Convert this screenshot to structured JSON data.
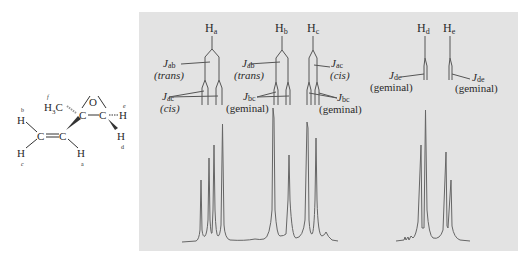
{
  "molecule": {
    "name": "2-methyl-2-vinyloxirane",
    "atoms": {
      "O": "O",
      "C": "C",
      "H": "H",
      "H3C_main": "H",
      "H3C_sub": "3",
      "H3C_tail": "C"
    },
    "proton_labels": {
      "a": "a",
      "b": "b",
      "c": "c",
      "d": "d",
      "e": "e",
      "f": "f"
    }
  },
  "spectrum": {
    "background_color": "#e3e3e3",
    "line_color": "#555555",
    "signals": [
      {
        "id": "Ha",
        "label_main": "H",
        "label_sub": "a"
      },
      {
        "id": "Hb",
        "label_main": "H",
        "label_sub": "b"
      },
      {
        "id": "Hc",
        "label_main": "H",
        "label_sub": "c"
      },
      {
        "id": "Hd",
        "label_main": "H",
        "label_sub": "d"
      },
      {
        "id": "He",
        "label_main": "H",
        "label_sub": "e"
      }
    ],
    "coupling_labels": [
      {
        "id": "Jab_a",
        "J": "J",
        "sub": "ab",
        "desc": "(trans)",
        "desc_italic": true
      },
      {
        "id": "Jac_a",
        "J": "J",
        "sub": "ac",
        "desc": "(cis)",
        "desc_italic": true
      },
      {
        "id": "Jab_b",
        "J": "J",
        "sub": "ab",
        "desc": "(trans)",
        "desc_italic": true
      },
      {
        "id": "Jbc_b",
        "J": "J",
        "sub": "bc",
        "desc": "(geminal)",
        "desc_italic": false
      },
      {
        "id": "Jac_c",
        "J": "J",
        "sub": "ac",
        "desc": "(cis)",
        "desc_italic": true
      },
      {
        "id": "Jbc_c",
        "J": "J",
        "sub": "bc",
        "desc": "(geminal)",
        "desc_italic": false
      },
      {
        "id": "Jde_d",
        "J": "J",
        "sub": "de",
        "desc": "(geminal)",
        "desc_italic": false
      },
      {
        "id": "Jde_e",
        "J": "J",
        "sub": "de",
        "desc": "(geminal)",
        "desc_italic": false
      }
    ]
  }
}
